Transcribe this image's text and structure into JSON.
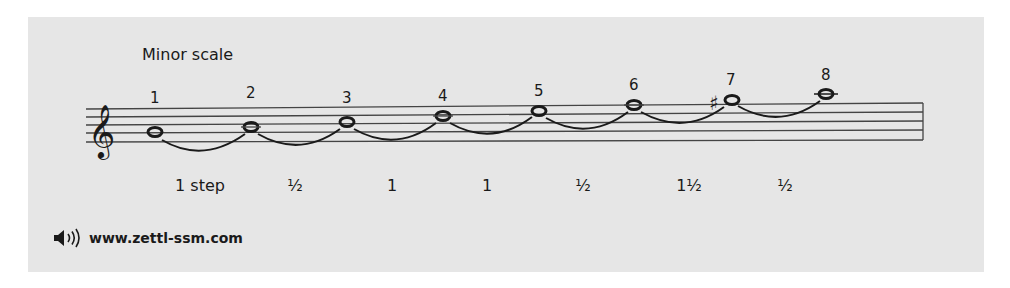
{
  "title": "Minor scale",
  "notes": [
    {
      "degree": "1",
      "accidental": ""
    },
    {
      "degree": "2",
      "accidental": ""
    },
    {
      "degree": "3",
      "accidental": ""
    },
    {
      "degree": "4",
      "accidental": ""
    },
    {
      "degree": "5",
      "accidental": ""
    },
    {
      "degree": "6",
      "accidental": ""
    },
    {
      "degree": "7",
      "accidental": "♯"
    },
    {
      "degree": "8",
      "accidental": ""
    }
  ],
  "steps": [
    "1 step",
    "½",
    "1",
    "1",
    "½",
    "1½",
    "½"
  ],
  "footer": {
    "icon": "speaker-icon",
    "url": "www.zettl-ssm.com"
  },
  "colors": {
    "panel": "#e6e6e6",
    "ink": "#1a1a1a",
    "staff_line": "#444444"
  }
}
